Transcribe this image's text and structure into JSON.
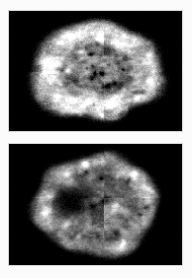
{
  "figure": {
    "modality": "Nuclear medicine brain perfusion tomography",
    "colormap": "grayscale",
    "background_color": "#000000",
    "page_color": "#ffffff",
    "panel_border_color": "#d2d2d2",
    "panel_count": 2,
    "orientation": "axial"
  },
  "panels": [
    {
      "id": "panel-top",
      "label": "A",
      "caption": "",
      "description": "Axial brain slice with bright continuous cortical rim and mottled heterogeneous interior uptake",
      "background_color": "#000000",
      "brain": {
        "center_x_pct": 50,
        "center_y_pct": 50,
        "radius_x_pct": 38,
        "radius_y_pct": 43,
        "rim_intensity": 235,
        "interior_mean_intensity": 125,
        "defect_present": false,
        "bright_rim": true,
        "faint_marking_below": true
      }
    },
    {
      "id": "panel-bottom",
      "label": "B",
      "caption": "",
      "description": "Axial brain slice with large dark photopenic defect in the left anterior region and scattered bright focal hot spots",
      "background_color": "#000000",
      "brain": {
        "center_x_pct": 50,
        "center_y_pct": 50,
        "radius_x_pct": 38,
        "radius_y_pct": 41,
        "rim_intensity": 170,
        "interior_mean_intensity": 130,
        "defect_present": true,
        "defect_location": "left-anterior",
        "defect_center_x_pct": 35,
        "defect_center_y_pct": 46,
        "defect_intensity": 10,
        "bright_rim": false,
        "hot_spot_count": 14
      }
    }
  ],
  "chart_data": {
    "type": "heatmap",
    "xlabel": "",
    "ylabel": "",
    "colormap": "gray",
    "vmin": 0,
    "vmax": 255,
    "grid": false,
    "legend": "none",
    "panels": [
      "A",
      "B"
    ],
    "series": [
      {
        "name": "A",
        "values": [
          235,
          125,
          0
        ]
      },
      {
        "name": "B",
        "values": [
          170,
          130,
          10
        ]
      }
    ]
  }
}
